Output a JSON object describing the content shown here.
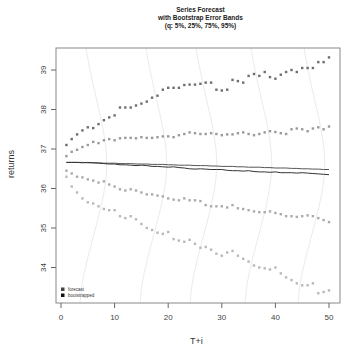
{
  "chart_data": {
    "type": "scatter",
    "title": "Series Forecast",
    "subtitle": "with Bootstrap Error Bands",
    "subtitle2": "(q: 5%, 25%, 75%, 95%)",
    "xlabel": "T+i",
    "ylabel": "returns",
    "xlim": [
      0,
      50
    ],
    "ylim": [
      33.2,
      39.5
    ],
    "xticks": [
      0,
      10,
      20,
      30,
      40,
      50
    ],
    "yticks": [
      34,
      35,
      36,
      37,
      38,
      39
    ],
    "grid": false,
    "legend_position": "bottom-left",
    "legend": [
      "forecast",
      "bootstrapped"
    ],
    "x": [
      1,
      2,
      3,
      4,
      5,
      6,
      7,
      8,
      9,
      10,
      11,
      12,
      13,
      14,
      15,
      16,
      17,
      18,
      19,
      20,
      21,
      22,
      23,
      24,
      25,
      26,
      27,
      28,
      29,
      30,
      31,
      32,
      33,
      34,
      35,
      36,
      37,
      38,
      39,
      40,
      41,
      42,
      43,
      44,
      45,
      46,
      47,
      48,
      49,
      50
    ],
    "series": [
      {
        "name": "forecast",
        "kind": "line",
        "color": "#555555",
        "values": [
          36.66,
          36.66,
          36.66,
          36.66,
          36.65,
          36.65,
          36.65,
          36.64,
          36.64,
          36.64,
          36.63,
          36.63,
          36.63,
          36.62,
          36.62,
          36.62,
          36.61,
          36.61,
          36.61,
          36.6,
          36.6,
          36.59,
          36.59,
          36.59,
          36.58,
          36.58,
          36.58,
          36.57,
          36.57,
          36.56,
          36.56,
          36.56,
          36.55,
          36.55,
          36.54,
          36.54,
          36.54,
          36.53,
          36.53,
          36.52,
          36.52,
          36.52,
          36.51,
          36.51,
          36.5,
          36.5,
          36.49,
          36.49,
          36.48,
          36.48
        ]
      },
      {
        "name": "bootstrapped",
        "kind": "line",
        "color": "#333333",
        "values": [
          36.66,
          36.66,
          36.66,
          36.65,
          36.66,
          36.65,
          36.64,
          36.63,
          36.62,
          36.62,
          36.6,
          36.6,
          36.59,
          36.58,
          36.59,
          36.58,
          36.56,
          36.56,
          36.55,
          36.54,
          36.55,
          36.53,
          36.52,
          36.5,
          36.49,
          36.5,
          36.49,
          36.48,
          36.48,
          36.48,
          36.46,
          36.45,
          36.45,
          36.44,
          36.45,
          36.43,
          36.42,
          36.42,
          36.41,
          36.42,
          36.4,
          36.4,
          36.4,
          36.39,
          36.4,
          36.39,
          36.38,
          36.37,
          36.36,
          36.35
        ]
      },
      {
        "name": "q95",
        "kind": "points",
        "color": "#6e6e6e",
        "values": [
          37.1,
          37.25,
          37.37,
          37.47,
          37.55,
          37.53,
          37.63,
          37.73,
          37.8,
          37.85,
          38.05,
          38.05,
          38.05,
          38.1,
          38.15,
          38.2,
          38.3,
          38.35,
          38.5,
          38.55,
          38.55,
          38.55,
          38.62,
          38.63,
          38.63,
          38.65,
          38.68,
          38.68,
          38.5,
          38.48,
          38.5,
          38.75,
          38.72,
          38.68,
          38.85,
          38.9,
          38.85,
          38.95,
          38.82,
          38.78,
          38.88,
          38.95,
          39.0,
          38.95,
          39.05,
          39.05,
          39.05,
          39.2,
          39.2,
          39.32
        ]
      },
      {
        "name": "q75",
        "kind": "points",
        "color": "#9a9a9a",
        "values": [
          36.82,
          36.93,
          36.98,
          37.05,
          37.1,
          37.18,
          37.15,
          37.22,
          37.25,
          37.22,
          37.27,
          37.28,
          37.28,
          37.27,
          37.3,
          37.28,
          37.28,
          37.3,
          37.32,
          37.32,
          37.3,
          37.35,
          37.38,
          37.42,
          37.4,
          37.38,
          37.38,
          37.4,
          37.38,
          37.35,
          37.37,
          37.37,
          37.4,
          37.42,
          37.38,
          37.35,
          37.38,
          37.42,
          37.45,
          37.43,
          37.4,
          37.38,
          37.5,
          37.52,
          37.5,
          37.45,
          37.52,
          37.55,
          37.5,
          37.57
        ]
      },
      {
        "name": "q25",
        "kind": "points",
        "color": "#ababab",
        "values": [
          36.45,
          36.38,
          36.3,
          36.28,
          36.23,
          36.2,
          36.15,
          36.18,
          36.1,
          36.05,
          35.98,
          35.95,
          35.98,
          35.95,
          35.9,
          35.85,
          35.85,
          35.82,
          35.8,
          35.75,
          35.72,
          35.7,
          35.75,
          35.7,
          35.7,
          35.68,
          35.58,
          35.55,
          35.55,
          35.55,
          35.52,
          35.58,
          35.5,
          35.48,
          35.45,
          35.42,
          35.4,
          35.4,
          35.42,
          35.38,
          35.35,
          35.3,
          35.3,
          35.28,
          35.3,
          35.32,
          35.3,
          35.25,
          35.2,
          35.15
        ]
      },
      {
        "name": "q05",
        "kind": "points",
        "color": "#b8b8b8",
        "values": [
          36.3,
          36.05,
          35.9,
          35.75,
          35.65,
          35.62,
          35.55,
          35.48,
          35.45,
          35.45,
          35.3,
          35.25,
          35.3,
          35.22,
          35.1,
          35.0,
          34.95,
          34.88,
          34.85,
          34.9,
          34.72,
          34.68,
          34.65,
          34.7,
          34.6,
          34.5,
          34.52,
          34.45,
          34.35,
          34.3,
          34.38,
          34.42,
          34.3,
          34.22,
          34.15,
          34.05,
          34.0,
          33.98,
          33.95,
          34.0,
          33.85,
          33.75,
          33.68,
          33.6,
          33.55,
          33.55,
          33.6,
          33.35,
          33.38,
          33.42
        ]
      }
    ]
  }
}
